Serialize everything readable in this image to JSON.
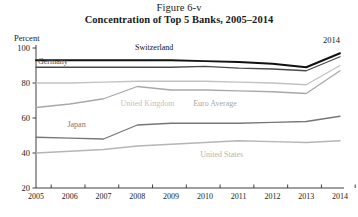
{
  "figure": {
    "number": "Figure 6-v",
    "title": "Concentration of Top 5 Banks, 2005–2014",
    "unit_label": "Percent",
    "annotation": "2014"
  },
  "chart_data": {
    "type": "line",
    "title": "Concentration of Top 5 Banks, 2005–2014",
    "subtitle": "Figure 6-v",
    "xlabel": "",
    "ylabel": "Percent",
    "ylim": [
      20,
      100
    ],
    "xlim": [
      2005,
      2014
    ],
    "yticks": [
      20,
      40,
      60,
      80,
      100
    ],
    "grid": false,
    "legend": "inline-labels",
    "annotations": [
      "2014"
    ],
    "x": [
      2005,
      2006,
      2007,
      2008,
      2009,
      2010,
      2011,
      2012,
      2013,
      2014
    ],
    "categories": [
      "2005",
      "2006",
      "2007",
      "2008",
      "2009",
      "2010",
      "2011",
      "2012",
      "2013",
      "2014"
    ],
    "series": [
      {
        "name": "Switzerland",
        "color": "#111111",
        "width": 1.9,
        "label_x": 2008.5,
        "label_y": 99,
        "values": [
          93,
          93,
          93,
          93,
          93,
          92.5,
          92,
          91,
          89,
          97
        ]
      },
      {
        "name": "Germany",
        "color": "#4a4a4a",
        "width": 1.3,
        "label_x": 2005.5,
        "label_y": 91,
        "values": [
          89,
          89,
          89,
          89,
          89,
          89.5,
          88.5,
          88,
          87,
          95
        ]
      },
      {
        "name": "United Kingdom",
        "color": "#c2c2c2",
        "width": 1.3,
        "label_x": 2008.3,
        "label_y": 67,
        "values": [
          80,
          80,
          80.5,
          81,
          81,
          81,
          80.5,
          80,
          79,
          90
        ]
      },
      {
        "name": "Euro Average",
        "color": "#a8a8a8",
        "width": 1.3,
        "label_x": 2010.3,
        "label_y": 67,
        "values": [
          66,
          68,
          71,
          78,
          76,
          76,
          75.5,
          75,
          74,
          87
        ]
      },
      {
        "name": "Japan",
        "color": "#777777",
        "width": 1.3,
        "label_x": 2006.2,
        "label_y": 55,
        "values": [
          49,
          48.5,
          48,
          56,
          57,
          57,
          57,
          57.5,
          58,
          61
        ]
      },
      {
        "name": "United States",
        "color": "#b5b5b5",
        "width": 1.3,
        "label_x": 2010.5,
        "label_y": 38,
        "values": [
          40,
          41,
          42,
          44,
          45,
          46,
          47,
          46.5,
          46,
          47
        ]
      }
    ]
  }
}
